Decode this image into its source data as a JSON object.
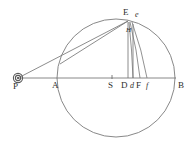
{
  "figure": {
    "caption": "",
    "background_color": "#ffffff",
    "line_color": "#6f6f6f",
    "label_color": "#2e2e2e",
    "width": 194,
    "height": 152
  },
  "points": [
    {
      "id": "P",
      "label": "P",
      "x": 18,
      "y": 78,
      "label_x": 15,
      "label_y": 83,
      "marker": "sun-circled-dot",
      "style": "capital"
    },
    {
      "id": "A",
      "label": "A",
      "x": 57,
      "y": 78,
      "label_x": 53,
      "label_y": 82,
      "marker": "none",
      "style": "capital"
    },
    {
      "id": "S",
      "label": "S",
      "x": 112,
      "y": 78,
      "label_x": 109,
      "label_y": 82,
      "marker": "tick",
      "style": "capital"
    },
    {
      "id": "D",
      "label": "D",
      "x": 126,
      "y": 78,
      "label_x": 122,
      "label_y": 82,
      "marker": "none",
      "style": "capital"
    },
    {
      "id": "d",
      "label": "d",
      "x": 133,
      "y": 78,
      "label_x": 131,
      "label_y": 82,
      "marker": "none",
      "style": "small"
    },
    {
      "id": "F",
      "label": "F",
      "x": 140,
      "y": 78,
      "label_x": 137,
      "label_y": 82,
      "marker": "none",
      "style": "capital"
    },
    {
      "id": "f",
      "label": "f",
      "x": 147,
      "y": 78,
      "label_x": 146,
      "label_y": 82,
      "marker": "none",
      "style": "small"
    },
    {
      "id": "B",
      "label": "B",
      "x": 175,
      "y": 78,
      "label_x": 177,
      "label_y": 82,
      "marker": "none",
      "style": "capital"
    },
    {
      "id": "E",
      "label": "E",
      "x": 127,
      "y": 21,
      "label_x": 123,
      "label_y": 9,
      "marker": "none",
      "style": "capital"
    },
    {
      "id": "e",
      "label": "e",
      "x": 135,
      "y": 22,
      "label_x": 135,
      "label_y": 12,
      "marker": "none",
      "style": "small"
    },
    {
      "id": "H",
      "label": "H",
      "x": 128,
      "y": 33,
      "label_x": 126,
      "label_y": 28,
      "marker": "none",
      "style": "tiny"
    }
  ],
  "circle": {
    "center_x": 116,
    "center_y": 78,
    "radius": 59,
    "diameter_label_left": "A",
    "diameter_label_right": "B"
  },
  "lines": {
    "baseline": {
      "from": "P",
      "to": "B",
      "description": "horizontal axis through P A S D F B"
    },
    "ray_pe": {
      "from": "P",
      "to": "E",
      "description": "sight line from P to E"
    },
    "vertical_ed": {
      "from": "E",
      "to": "D",
      "description": "perpendicular from E to D"
    },
    "vertical_ef": {
      "from": "e",
      "to": "f",
      "description": "perpendicular from e to f"
    }
  },
  "chords": [
    {
      "name": "chord-E-d",
      "from_x": 129,
      "to_x": 133
    },
    {
      "name": "chord-E-F",
      "from_x": 131,
      "to_x": 140
    },
    {
      "name": "chord-E-f",
      "from_x": 133,
      "to_x": 147
    }
  ]
}
